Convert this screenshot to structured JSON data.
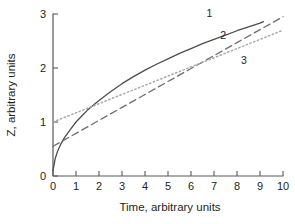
{
  "chart_data": {
    "type": "line",
    "title": "",
    "xlabel": "Time, arbitrary units",
    "ylabel": "Z, arbitrary units",
    "xlim": [
      0,
      10
    ],
    "ylim": [
      0,
      3
    ],
    "xticks": [
      "0",
      "1",
      "2",
      "3",
      "4",
      "5",
      "6",
      "7",
      "8",
      "9",
      "10"
    ],
    "yticks": [
      "0",
      "1",
      "2",
      "3"
    ],
    "grid": false,
    "legend_position": "inline-curve-labels",
    "series": [
      {
        "name": "1",
        "style": "solid",
        "color": "#4d4d4d",
        "x": [
          0,
          0.1,
          0.2,
          0.35,
          0.5,
          0.75,
          1.0,
          1.25,
          1.5,
          2.0,
          2.5,
          3.0,
          3.5,
          4.0,
          4.5,
          5.0,
          5.5,
          6.0,
          6.5,
          7.0,
          7.5,
          8.0,
          8.5,
          9.0,
          9.15
        ],
        "values": [
          0.1,
          0.33,
          0.46,
          0.6,
          0.71,
          0.86,
          1.0,
          1.11,
          1.22,
          1.4,
          1.56,
          1.71,
          1.84,
          1.96,
          2.07,
          2.17,
          2.27,
          2.36,
          2.45,
          2.53,
          2.61,
          2.69,
          2.76,
          2.83,
          2.86
        ]
      },
      {
        "name": "2",
        "style": "dashed",
        "color": "#6d6e71",
        "x": [
          0,
          1,
          2,
          3,
          4,
          5,
          6,
          7,
          8,
          9,
          10
        ],
        "values": [
          0.55,
          0.79,
          1.03,
          1.27,
          1.51,
          1.75,
          1.99,
          2.23,
          2.47,
          2.71,
          2.95
        ]
      },
      {
        "name": "3",
        "style": "dotted",
        "color": "#a7a9ac",
        "x": [
          0,
          1,
          2,
          3,
          4,
          5,
          6,
          7,
          8,
          9,
          10
        ],
        "values": [
          1.0,
          1.17,
          1.34,
          1.51,
          1.68,
          1.85,
          2.02,
          2.19,
          2.36,
          2.53,
          2.7
        ]
      }
    ],
    "series_labels": [
      {
        "text": "1",
        "x": 6.8,
        "y": 2.95
      },
      {
        "text": "2",
        "x": 7.4,
        "y": 2.53
      },
      {
        "text": "3",
        "x": 8.3,
        "y": 2.08
      }
    ]
  }
}
